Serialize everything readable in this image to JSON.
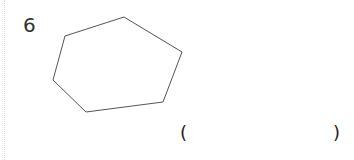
{
  "question": {
    "number": "6",
    "shape": "heptagon-like polygon",
    "answer_open": "(",
    "answer_close": ")",
    "answer_value": ""
  },
  "colors": {
    "stroke": "#555555",
    "text": "#333333"
  }
}
